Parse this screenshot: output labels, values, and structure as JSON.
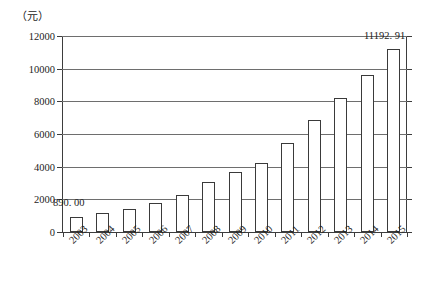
{
  "chart_data": {
    "type": "bar",
    "title": "",
    "xlabel": "",
    "ylabel": "（元）",
    "unit_label": "（元）",
    "categories": [
      "2003",
      "2004",
      "2005",
      "2006",
      "2007",
      "2008",
      "2009",
      "2010",
      "2011",
      "2012",
      "2013",
      "2014",
      "2015"
    ],
    "values": [
      890.0,
      1150,
      1400,
      1750,
      2250,
      3050,
      3650,
      4250,
      5450,
      6850,
      8200,
      9600,
      11192.91
    ],
    "ylim": [
      0,
      12000
    ],
    "yticks": [
      0,
      2000,
      4000,
      6000,
      8000,
      10000,
      12000
    ],
    "ytick_labels": [
      "0",
      "2000",
      "4000",
      "6000",
      "8000",
      "10000",
      "12000"
    ],
    "grid": true,
    "legend": null,
    "legend_position": "none",
    "annotations": [
      {
        "text": "890. 00",
        "category": "2003",
        "value": 890.0
      },
      {
        "text": "11192. 91",
        "category": "2015",
        "value": 11192.91
      }
    ],
    "series_style": {
      "bar_fill": "#ffffff",
      "bar_border": "#3a3a3a",
      "grid_color": "#6e6e6e",
      "axis_color": "#3d3d3d",
      "background": "#ffffff",
      "text_color": "#1c1c1c"
    }
  }
}
